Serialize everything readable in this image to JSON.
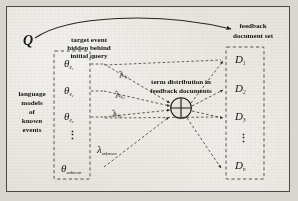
{
  "figure": {
    "type": "diagram",
    "caption_absent": true,
    "background_color": "#e6e3dc",
    "border_color": "#4a4a48",
    "ink_color": "#14140f"
  },
  "query": {
    "symbol": "Q",
    "annotation_line1": "target event",
    "annotation_line2": "hidden behind",
    "annotation_line3": "initial query"
  },
  "left_panel": {
    "caption_line1": "language",
    "caption_line2": "models",
    "caption_line3": "of",
    "caption_line4": "known",
    "caption_line5": "events",
    "models": [
      {
        "symbol": "θ",
        "subscript": "e₁"
      },
      {
        "symbol": "θ",
        "subscript": "e₂"
      },
      {
        "symbol": "θ",
        "subscript": "e₃"
      },
      {
        "symbol": "θ",
        "subscript": "unknown"
      }
    ],
    "vertical_ellipsis": "⋮"
  },
  "weights": [
    {
      "symbol": "λ",
      "subscript": "e₁"
    },
    {
      "symbol": "λ",
      "subscript": "e₂"
    },
    {
      "symbol": "λ",
      "subscript": "e₃"
    },
    {
      "symbol": "λ",
      "subscript": "unknown"
    }
  ],
  "mixture_node": {
    "glyph": "⊕",
    "label_line1": "term distribution in",
    "label_line2": "feedback documents"
  },
  "right_panel": {
    "caption_line1": "feedback",
    "caption_line2": "document set",
    "documents": [
      {
        "symbol": "D",
        "subscript": "1"
      },
      {
        "symbol": "D",
        "subscript": "2"
      },
      {
        "symbol": "D",
        "subscript": "3"
      },
      {
        "symbol": "D",
        "subscript": "n"
      }
    ],
    "vertical_ellipsis": "⋮"
  }
}
